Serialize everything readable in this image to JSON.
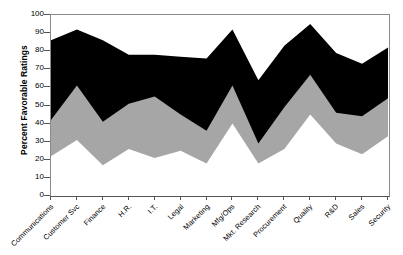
{
  "chart_data": {
    "type": "area",
    "stacked": true,
    "title": "",
    "xlabel": "",
    "ylabel": "Percent Favorable Ratings",
    "ylim": [
      0,
      100
    ],
    "ytick_step": 10,
    "yticks": [
      0,
      10,
      20,
      30,
      40,
      50,
      60,
      70,
      80,
      90,
      100
    ],
    "grid": false,
    "legend": "none",
    "categories": [
      "Communications",
      "Customer Svc",
      "Finance",
      "H.R.",
      "I.T.",
      "Legal",
      "Marketing",
      "Mfg/Ops",
      "Mkt. Research",
      "Procurement",
      "Quality",
      "R&D",
      "Sales",
      "Security"
    ],
    "series": [
      {
        "name": "bottom",
        "color": "#ffffff",
        "values": [
          22,
          31,
          17,
          26,
          21,
          25,
          18,
          40,
          18,
          26,
          45,
          29,
          23,
          33
        ]
      },
      {
        "name": "middle",
        "color": "#a6a6a6",
        "values": [
          42,
          61,
          41,
          51,
          55,
          45,
          36,
          61,
          29,
          49,
          67,
          46,
          44,
          54
        ]
      },
      {
        "name": "top",
        "color": "#000000",
        "values": [
          86,
          92,
          86,
          78,
          78,
          77,
          76,
          92,
          64,
          83,
          95,
          79,
          73,
          82
        ]
      }
    ]
  }
}
